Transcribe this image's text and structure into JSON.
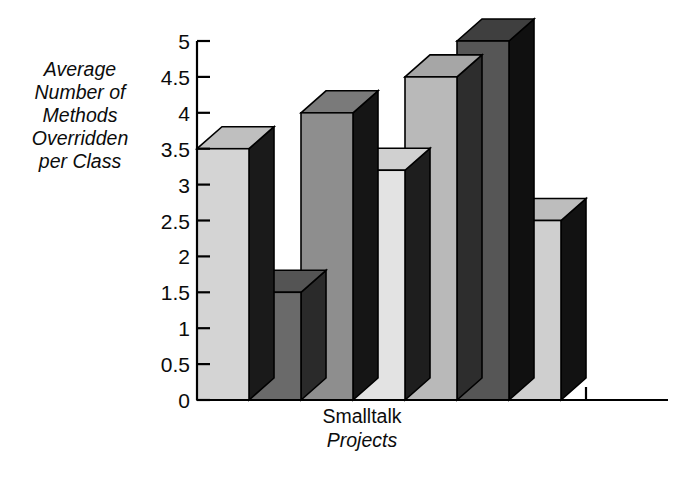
{
  "chart_data": {
    "type": "bar",
    "title": "",
    "subtitle": "",
    "ylabel": "Average Number of Methods Overridden per Class",
    "ylabel_lines": [
      "Average",
      "Number of",
      "Methods",
      "Overridden",
      "per Class"
    ],
    "xlabel": "Smalltalk Projects",
    "xlabel_lines": [
      "Smalltalk",
      "Projects"
    ],
    "categories": [
      "1",
      "2",
      "3",
      "4",
      "5",
      "6",
      "7"
    ],
    "values": [
      3.5,
      1.5,
      4.0,
      3.2,
      4.5,
      5.0,
      2.5
    ],
    "ylim": [
      0,
      5
    ],
    "xlim": [
      0,
      7
    ],
    "yticks": [
      0,
      0.5,
      1,
      1.5,
      2,
      2.5,
      3,
      3.5,
      4,
      4.5,
      5
    ],
    "ytick_labels": [
      "0",
      "0.5",
      "1",
      "1.5",
      "2",
      "2.5",
      "3",
      "3.5",
      "4",
      "4.5",
      "5"
    ],
    "xtick_labels": [],
    "grid": false,
    "legend": false,
    "style": "3d-bar",
    "bar_colors": [
      "#d4d4d4",
      "#6a6a6a",
      "#8e8e8e",
      "#e3e3e3",
      "#b9b9b9",
      "#565656",
      "#cfcfcf"
    ],
    "bar_top_colors": [
      "#bfbfbf",
      "#545454",
      "#7a7a7a",
      "#d0d0d0",
      "#a6a6a6",
      "#3f3f3f",
      "#bdbdbd"
    ],
    "bar_side_colors": [
      "#1a1a1a",
      "#2a2a2a",
      "#151515",
      "#1e1e1e",
      "#2d2d2d",
      "#101010",
      "#121212"
    ],
    "axis_color": "#000000",
    "background": "#ffffff"
  },
  "axes": {
    "y_axis_name": "value-axis",
    "x_axis_name": "category-axis"
  }
}
